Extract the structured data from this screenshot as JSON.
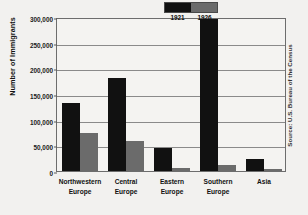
{
  "chart_data": {
    "type": "bar",
    "title": "",
    "xlabel": "",
    "ylabel": "Number of Immigrants",
    "ylim": [
      0,
      300000
    ],
    "ytick_labels": [
      "300,000",
      "250,000",
      "200,000",
      "150,000",
      "100,000",
      "50,000",
      "0"
    ],
    "ytick_values": [
      300000,
      250000,
      200000,
      150000,
      100000,
      50000,
      0
    ],
    "grid": true,
    "legend_position": "top-right",
    "categories": [
      "Northwestern Europe",
      "Central Europe",
      "Eastern Europe",
      "Southern Europe",
      "Asia"
    ],
    "category_lines": [
      [
        "Northwestern",
        "Europe"
      ],
      [
        "Central",
        "Europe"
      ],
      [
        "Eastern",
        "Europe"
      ],
      [
        "Southern",
        "Europe"
      ],
      [
        "Asia",
        ""
      ]
    ],
    "series": [
      {
        "name": "1921",
        "color": "#111111",
        "values": [
          133000,
          182000,
          45000,
          297000,
          24000
        ]
      },
      {
        "name": "1926",
        "color": "#6b6b6b",
        "values": [
          74000,
          59000,
          5000,
          11000,
          3000
        ]
      }
    ],
    "source": "Source: U.S. Bureau of the Census"
  },
  "legend": {
    "entries": [
      {
        "label": "1921",
        "color": "#111111"
      },
      {
        "label": "1926",
        "color": "#6b6b6b"
      }
    ]
  }
}
